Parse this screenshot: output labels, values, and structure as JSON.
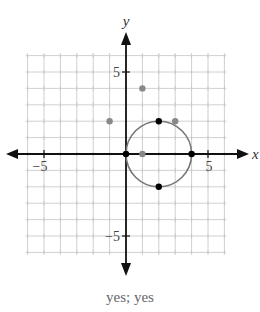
{
  "chart_data": {
    "type": "scatter",
    "title": "",
    "xlabel": "x",
    "ylabel": "y",
    "xlim": [
      -6,
      6
    ],
    "ylim": [
      -6,
      6
    ],
    "grid": true,
    "x_tick_labels": [
      "-5",
      "5"
    ],
    "y_tick_labels": [
      "5",
      "-5"
    ],
    "circle": {
      "center": [
        2,
        0
      ],
      "radius": 2,
      "color": "#777777"
    },
    "series": [
      {
        "name": "points on circle",
        "color": "#000000",
        "points": [
          [
            0,
            0
          ],
          [
            4,
            0
          ],
          [
            2,
            2
          ],
          [
            2,
            -2
          ]
        ]
      },
      {
        "name": "other points",
        "color": "#888888",
        "points": [
          [
            -1,
            2
          ],
          [
            1,
            4
          ],
          [
            3,
            2
          ],
          [
            1,
            0
          ]
        ]
      }
    ]
  },
  "axes": {
    "x_label": "x",
    "y_label": "y",
    "tick_neg5_x": "−5",
    "tick_pos5_x": "5",
    "tick_pos5_y": "5",
    "tick_neg5_y": "−5"
  },
  "caption": "yes; yes"
}
